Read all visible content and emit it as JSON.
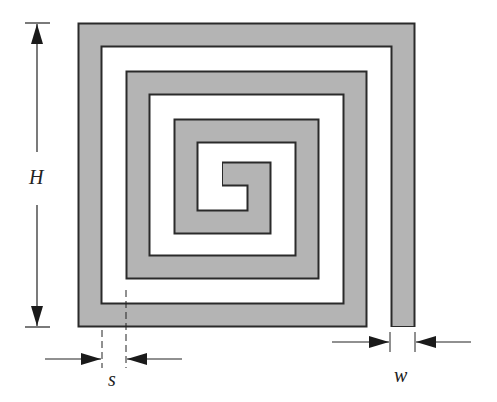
{
  "figure": {
    "type": "square spiral inductor layout",
    "labels": {
      "height": "H",
      "spacing": "s",
      "width": "w"
    },
    "colors": {
      "track_fill": "#b4b4b4",
      "track_outline": "#2a2a2a",
      "dimension_lines": "#222222",
      "background": "#ffffff"
    }
  }
}
